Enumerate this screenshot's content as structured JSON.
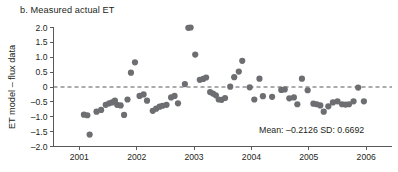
{
  "figure": {
    "panel_label": "b. Measured actual ET"
  },
  "chart_data": {
    "type": "scatter",
    "title": "b. Measured actual ET",
    "xlabel": "",
    "ylabel": "ET model – flux data",
    "xlim": [
      2000.55,
      2006.45
    ],
    "ylim": [
      -2.0,
      2.0
    ],
    "grid": false,
    "legend": null,
    "x_ticks": [
      "2001",
      "2002",
      "2003",
      "2004",
      "2005",
      "2006"
    ],
    "x_tick_values": [
      2001,
      2002,
      2003,
      2004,
      2005,
      2006
    ],
    "y_ticks": [
      "2.0",
      "1.5",
      "1.0",
      "0.5",
      "0",
      "–0.5",
      "–1.0",
      "–1.5",
      "–2.0"
    ],
    "y_tick_values": [
      2.0,
      1.5,
      1.0,
      0.5,
      0,
      -0.5,
      -1.0,
      -1.5,
      -2.0
    ],
    "reference_line": {
      "y": 0,
      "style": "dashed"
    },
    "marker": {
      "shape": "circle",
      "color": "#6d6e71",
      "size": 3.1
    },
    "annotations": [
      {
        "text": "Mean: –0.2126  SD: 0.6692",
        "x": 2005.05,
        "y": -1.55
      }
    ],
    "statistics": {
      "mean": -0.2126,
      "sd": 0.6692
    },
    "points": [
      [
        2001.08,
        -0.93
      ],
      [
        2001.14,
        -0.95
      ],
      [
        2001.18,
        -1.6
      ],
      [
        2001.3,
        -0.83
      ],
      [
        2001.38,
        -0.77
      ],
      [
        2001.46,
        -0.6
      ],
      [
        2001.52,
        -0.55
      ],
      [
        2001.57,
        -0.52
      ],
      [
        2001.62,
        -0.46
      ],
      [
        2001.66,
        -0.6
      ],
      [
        2001.72,
        -0.62
      ],
      [
        2001.78,
        -0.94
      ],
      [
        2001.84,
        -0.42
      ],
      [
        2001.9,
        0.48
      ],
      [
        2001.97,
        0.83
      ],
      [
        2002.05,
        -0.3
      ],
      [
        2002.12,
        -0.25
      ],
      [
        2002.18,
        -0.46
      ],
      [
        2002.28,
        -0.8
      ],
      [
        2002.34,
        -0.73
      ],
      [
        2002.4,
        -0.66
      ],
      [
        2002.45,
        -0.63
      ],
      [
        2002.52,
        -0.6
      ],
      [
        2002.6,
        -0.35
      ],
      [
        2002.66,
        -0.3
      ],
      [
        2002.72,
        -0.55
      ],
      [
        2002.84,
        0.1
      ],
      [
        2002.9,
        1.99
      ],
      [
        2002.94,
        2.0
      ],
      [
        2003.02,
        1.09
      ],
      [
        2003.1,
        0.24
      ],
      [
        2003.16,
        0.27
      ],
      [
        2003.21,
        0.32
      ],
      [
        2003.28,
        -0.17
      ],
      [
        2003.33,
        -0.22
      ],
      [
        2003.38,
        -0.28
      ],
      [
        2003.43,
        -0.42
      ],
      [
        2003.48,
        -0.43
      ],
      [
        2003.54,
        -0.37
      ],
      [
        2003.63,
        0.01
      ],
      [
        2003.7,
        0.33
      ],
      [
        2003.78,
        0.52
      ],
      [
        2003.84,
        0.88
      ],
      [
        2003.97,
        -0.01
      ],
      [
        2004.05,
        -0.42
      ],
      [
        2004.14,
        0.28
      ],
      [
        2004.2,
        -0.31
      ],
      [
        2004.36,
        -0.33
      ],
      [
        2004.52,
        -0.1
      ],
      [
        2004.58,
        -0.08
      ],
      [
        2004.66,
        -0.38
      ],
      [
        2004.74,
        -0.35
      ],
      [
        2004.8,
        -0.58
      ],
      [
        2004.88,
        0.28
      ],
      [
        2004.98,
        -0.11
      ],
      [
        2005.08,
        -0.56
      ],
      [
        2005.14,
        -0.58
      ],
      [
        2005.2,
        -0.62
      ],
      [
        2005.26,
        -0.83
      ],
      [
        2005.34,
        -0.65
      ],
      [
        2005.42,
        -0.52
      ],
      [
        2005.5,
        -0.48
      ],
      [
        2005.58,
        -0.58
      ],
      [
        2005.64,
        -0.59
      ],
      [
        2005.7,
        -0.58
      ],
      [
        2005.78,
        -0.48
      ],
      [
        2005.86,
        -0.02
      ],
      [
        2005.96,
        -0.48
      ]
    ]
  }
}
